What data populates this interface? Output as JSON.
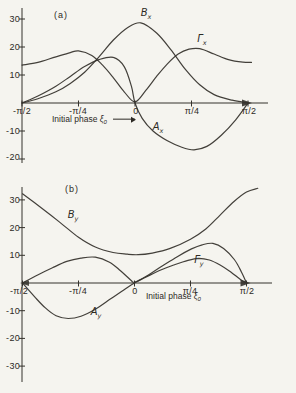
{
  "background_color": "#f5f4ef",
  "ink_color": "#35322c",
  "chart_data": [
    {
      "type": "line",
      "panel": "a",
      "tag": "(a)",
      "xlabel": "Initial phase",
      "xlabel_symbol": "ξ",
      "xlabel_symbol_sub": "0",
      "xlabel_has_arrow": true,
      "x_range_rad": [
        -1.5708,
        1.5708
      ],
      "ylim": [
        -22,
        32
      ],
      "grid": false,
      "legend": "inline curve labels",
      "x_ticks": [
        {
          "label": "-π/2",
          "value": -1.5708
        },
        {
          "label": "-π/4",
          "value": -0.7854
        },
        {
          "label": "0",
          "value": 0
        },
        {
          "label": "π/4",
          "value": 0.7854
        },
        {
          "label": "π/2",
          "value": 1.5708
        }
      ],
      "y_ticks": [
        {
          "label": "30",
          "value": 30
        },
        {
          "label": "20",
          "value": 20
        },
        {
          "label": "10",
          "value": 10
        },
        {
          "label": "-10",
          "value": -10
        },
        {
          "label": "-20",
          "value": -20
        }
      ],
      "series": [
        {
          "name": "Bx",
          "label": "B",
          "label_sub": "x",
          "points": [
            [
              -1.571,
              0
            ],
            [
              -1.35,
              1.5
            ],
            [
              -1.1,
              4
            ],
            [
              -0.9,
              7
            ],
            [
              -0.7,
              11
            ],
            [
              -0.5,
              16.5
            ],
            [
              -0.3,
              22.5
            ],
            [
              -0.1,
              27
            ],
            [
              0.08,
              28.6
            ],
            [
              0.3,
              25
            ],
            [
              0.5,
              19
            ],
            [
              0.7,
              12
            ],
            [
              0.9,
              6.5
            ],
            [
              1.1,
              3
            ],
            [
              1.35,
              1
            ],
            [
              1.571,
              0
            ]
          ]
        },
        {
          "name": "Gamma_x",
          "label": "Γ",
          "label_sub": "x",
          "points": [
            [
              -1.571,
              13.5
            ],
            [
              -1.35,
              14.5
            ],
            [
              -1.1,
              16.5
            ],
            [
              -0.9,
              18
            ],
            [
              -0.785,
              18.6
            ],
            [
              -0.6,
              17
            ],
            [
              -0.45,
              13.5
            ],
            [
              -0.3,
              9
            ],
            [
              -0.15,
              4
            ],
            [
              0,
              0.4
            ],
            [
              0.15,
              4.5
            ],
            [
              0.3,
              9.5
            ],
            [
              0.45,
              14
            ],
            [
              0.6,
              17.5
            ],
            [
              0.75,
              19.2
            ],
            [
              0.9,
              19.4
            ],
            [
              1.1,
              17.5
            ],
            [
              1.3,
              15.5
            ],
            [
              1.5,
              14.6
            ],
            [
              1.62,
              14.5
            ]
          ]
        },
        {
          "name": "Ax",
          "label": "A",
          "label_sub": "x",
          "points": [
            [
              -1.571,
              0
            ],
            [
              -1.35,
              2.5
            ],
            [
              -1.1,
              6
            ],
            [
              -0.9,
              9.5
            ],
            [
              -0.7,
              13
            ],
            [
              -0.5,
              15.5
            ],
            [
              -0.3,
              16.3
            ],
            [
              -0.15,
              13
            ],
            [
              -0.05,
              6
            ],
            [
              0,
              0
            ],
            [
              0.1,
              -5.5
            ],
            [
              0.25,
              -10
            ],
            [
              0.45,
              -13.5
            ],
            [
              0.65,
              -15.8
            ],
            [
              0.82,
              -16.7
            ],
            [
              1.0,
              -15.5
            ],
            [
              1.2,
              -11.5
            ],
            [
              1.4,
              -6
            ],
            [
              1.571,
              0
            ]
          ]
        }
      ]
    },
    {
      "type": "line",
      "panel": "b",
      "tag": "(b)",
      "xlabel": "Initial phase",
      "xlabel_symbol": "ξ",
      "xlabel_symbol_sub": "0",
      "xlabel_has_arrow": false,
      "x_range_rad": [
        -1.5708,
        1.5708
      ],
      "ylim": [
        -33,
        35
      ],
      "grid": false,
      "legend": "inline curve labels",
      "x_ticks": [
        {
          "label": "-π/2",
          "value": -1.5708
        },
        {
          "label": "-π/4",
          "value": -0.7854
        },
        {
          "label": "0",
          "value": 0
        },
        {
          "label": "π/4",
          "value": 0.7854
        },
        {
          "label": "π/2",
          "value": 1.5708
        }
      ],
      "y_ticks": [
        {
          "label": "30",
          "value": 30
        },
        {
          "label": "20",
          "value": 20
        },
        {
          "label": "10",
          "value": 10
        },
        {
          "label": "-10",
          "value": -10
        },
        {
          "label": "-20",
          "value": -20
        },
        {
          "label": "-30",
          "value": -30
        }
      ],
      "series": [
        {
          "name": "By",
          "label": "B",
          "label_sub": "y",
          "points": [
            [
              -1.571,
              32.2
            ],
            [
              -1.3,
              27
            ],
            [
              -1.05,
              22
            ],
            [
              -0.785,
              16.5
            ],
            [
              -0.55,
              13
            ],
            [
              -0.3,
              11
            ],
            [
              -0.1,
              10.4
            ],
            [
              0.05,
              10.2
            ],
            [
              0.25,
              10.8
            ],
            [
              0.5,
              12.5
            ],
            [
              0.785,
              15.8
            ],
            [
              1.0,
              19.5
            ],
            [
              1.2,
              24.5
            ],
            [
              1.4,
              29.5
            ],
            [
              1.571,
              32.8
            ],
            [
              1.73,
              34.2
            ]
          ]
        },
        {
          "name": "Gamma_y",
          "label": "Γ",
          "label_sub": "y",
          "points": [
            [
              -1.571,
              0
            ],
            [
              -1.35,
              3
            ],
            [
              -1.15,
              5.5
            ],
            [
              -0.95,
              7.8
            ],
            [
              -0.75,
              9
            ],
            [
              -0.55,
              9.3
            ],
            [
              -0.35,
              7.5
            ],
            [
              -0.2,
              4.5
            ],
            [
              -0.05,
              1
            ],
            [
              0,
              0.3
            ],
            [
              0.15,
              2
            ],
            [
              0.35,
              4.5
            ],
            [
              0.55,
              6.5
            ],
            [
              0.75,
              8.2
            ],
            [
              0.9,
              8.9
            ],
            [
              1.05,
              8.3
            ],
            [
              1.2,
              6.5
            ],
            [
              1.35,
              4
            ],
            [
              1.5,
              1
            ],
            [
              1.571,
              0
            ]
          ]
        },
        {
          "name": "Ay",
          "label": "A",
          "label_sub": "y",
          "points": [
            [
              -1.571,
              0
            ],
            [
              -1.4,
              -5
            ],
            [
              -1.25,
              -9
            ],
            [
              -1.1,
              -11.8
            ],
            [
              -0.93,
              -12.8
            ],
            [
              -0.75,
              -12
            ],
            [
              -0.55,
              -9.5
            ],
            [
              -0.35,
              -6
            ],
            [
              -0.15,
              -2.5
            ],
            [
              0,
              0
            ],
            [
              0.2,
              3
            ],
            [
              0.4,
              6.3
            ],
            [
              0.6,
              9.5
            ],
            [
              0.8,
              12.3
            ],
            [
              0.95,
              13.8
            ],
            [
              1.1,
              14.3
            ],
            [
              1.25,
              12.5
            ],
            [
              1.4,
              8.5
            ],
            [
              1.5,
              4
            ],
            [
              1.571,
              0
            ]
          ]
        }
      ]
    }
  ]
}
